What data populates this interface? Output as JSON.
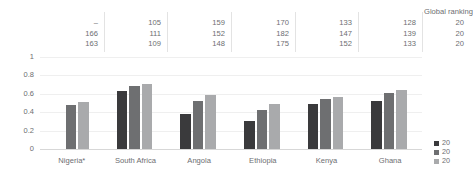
{
  "table": {
    "header_label": "Global ranking",
    "year_labels": [
      "20",
      "20",
      "20"
    ],
    "rows": [
      {
        "year": "20",
        "values": [
          "–",
          "105",
          "159",
          "170",
          "133",
          "128"
        ]
      },
      {
        "year": "20",
        "values": [
          "166",
          "111",
          "152",
          "182",
          "147",
          "139"
        ]
      },
      {
        "year": "20",
        "values": [
          "163",
          "109",
          "148",
          "175",
          "152",
          "133"
        ]
      }
    ]
  },
  "legend": {
    "items": [
      {
        "label": "20",
        "color": "#3a3a3c"
      },
      {
        "label": "20",
        "color": "#6e6f71"
      },
      {
        "label": "20",
        "color": "#a9aaac"
      }
    ]
  },
  "chart_data": {
    "type": "bar",
    "title": "",
    "xlabel": "",
    "ylabel": "",
    "ylim": [
      0,
      1
    ],
    "yticks": [
      "0",
      "0.2",
      "0.4",
      "0.6",
      "0.8",
      "1"
    ],
    "grid": true,
    "legend_position": "right",
    "categories": [
      "Nigeria*",
      "South Africa",
      "Angola",
      "Ethiopia",
      "Kenya",
      "Ghana"
    ],
    "series": [
      {
        "name": "20",
        "color": "#3a3a3c",
        "values": [
          null,
          0.63,
          0.38,
          0.3,
          0.49,
          0.52
        ]
      },
      {
        "name": "20",
        "color": "#6e6f71",
        "values": [
          0.48,
          0.68,
          0.52,
          0.42,
          0.54,
          0.61
        ]
      },
      {
        "name": "20",
        "color": "#a9aaac",
        "values": [
          0.51,
          0.71,
          0.59,
          0.49,
          0.57,
          0.64
        ]
      }
    ]
  }
}
